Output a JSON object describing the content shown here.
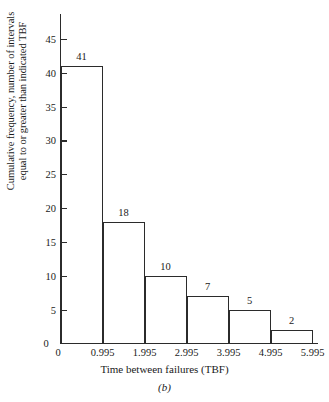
{
  "chart_data": {
    "type": "bar",
    "title": "",
    "caption": "(b)",
    "xlabel": "Time between failures (TBF)",
    "ylabel_line1": "Cumulative frequency, number of intervals",
    "ylabel_line2": "equal to or greater than indicated TBF",
    "categories": [
      "0.995",
      "1.995",
      "2.995",
      "3.995",
      "4.995",
      "5.995"
    ],
    "values": [
      41,
      18,
      10,
      7,
      5,
      2
    ],
    "bar_labels": [
      "41",
      "18",
      "10",
      "7",
      "5",
      "2"
    ],
    "x_tick_labels": [
      "0",
      "0.995",
      "1.995",
      "2.995",
      "3.995",
      "4.995",
      "5.995"
    ],
    "y_tick_labels": [
      "0",
      "5",
      "10",
      "15",
      "20",
      "25",
      "30",
      "35",
      "40",
      "45"
    ],
    "y_tick_values": [
      0,
      5,
      10,
      15,
      20,
      25,
      30,
      35,
      40,
      45
    ],
    "ylim": [
      0,
      47
    ],
    "xlim": [
      0,
      6.6
    ],
    "grid": false,
    "legend": null,
    "axis_color": "#2b2b2b",
    "bar_edge_color": "#2b2b2b",
    "bar_fill_color": "#ffffff",
    "background_color": "#ffffff"
  }
}
